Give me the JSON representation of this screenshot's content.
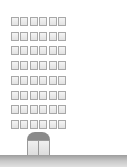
{
  "illustration": {
    "subject": "office-building",
    "window_grid": {
      "rows": 8,
      "columns": 6
    },
    "colors": {
      "window_border": "#a8a8a8",
      "window_fill": "#eeeeee",
      "dome": "#8a8a8a",
      "ground": "#a8a8a8",
      "background": "#ffffff"
    }
  }
}
